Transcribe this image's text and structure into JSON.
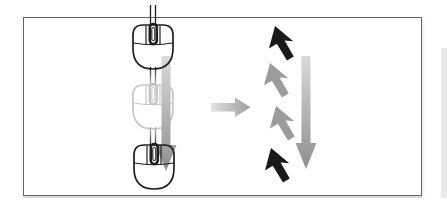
{
  "colors": {
    "page_bg": "#ffffff",
    "frame_bg": "#ffffff",
    "frame_border": "#646464",
    "outline_dark": "#1f1f1f",
    "outline_faded": "#c6c6c6",
    "arrow_light": "#d9d9d9",
    "arrow_dark": "#8f8f8f",
    "arrow_mid_light": "#e2e2e2",
    "arrow_mid_dark": "#9e9e9e",
    "cursor_black": "#1a1a1a",
    "cursor_gray": "#9c9c9c",
    "page_edge": "#e9e9e9"
  },
  "figure": {
    "left_panel": {
      "mouse_states": [
        "solid",
        "faded",
        "solid"
      ],
      "motion_direction": "down"
    },
    "transition": {
      "direction": "right"
    },
    "right_panel": {
      "pointer_states": [
        "black",
        "gray",
        "gray",
        "black"
      ],
      "motion_direction": "down"
    }
  }
}
